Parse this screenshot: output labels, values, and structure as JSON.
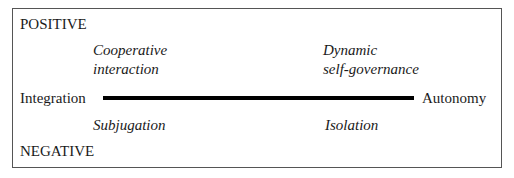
{
  "diagram": {
    "top_label": "POSITIVE",
    "bottom_label": "NEGATIVE",
    "axis": {
      "left_label": "Integration",
      "right_label": "Autonomy"
    },
    "quadrants": {
      "positive_integration": [
        "Cooperative",
        "interaction"
      ],
      "positive_autonomy": [
        "Dynamic",
        "self-governance"
      ],
      "negative_integration": "Subjugation",
      "negative_autonomy": "Isolation"
    }
  }
}
